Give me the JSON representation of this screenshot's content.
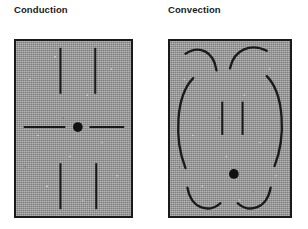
{
  "figure": {
    "width": 308,
    "height": 229,
    "background": "#ffffff",
    "ink_color": "#1a1a1a",
    "medium_fill": "#9a9a9a"
  },
  "panels": [
    {
      "id": "conduction",
      "title": "Conduction",
      "box": {
        "x": 14,
        "y": 39,
        "width": 119,
        "height": 179
      },
      "source_marker": {
        "label": "heat-source-dot",
        "x": 83,
        "y": 128,
        "radius": 5
      },
      "flow_description": "Straight arrows point inward from all four sides toward a central point",
      "arrows": [
        {
          "name": "arrow-down-left",
          "type": "straight",
          "direction": "down",
          "from": [
            60,
            47
          ],
          "to": [
            60,
            100
          ]
        },
        {
          "name": "arrow-down-right",
          "type": "straight",
          "direction": "down",
          "from": [
            96,
            47
          ],
          "to": [
            96,
            100
          ]
        },
        {
          "name": "arrow-right-inward",
          "type": "straight",
          "direction": "right",
          "from": [
            22,
            128
          ],
          "to": [
            71,
            128
          ]
        },
        {
          "name": "arrow-left-inward",
          "type": "straight",
          "direction": "left",
          "from": [
            126,
            128
          ],
          "to": [
            95,
            128
          ]
        },
        {
          "name": "arrow-up-left",
          "type": "straight",
          "direction": "up",
          "from": [
            60,
            211
          ],
          "to": [
            60,
            168
          ]
        },
        {
          "name": "arrow-up-right",
          "type": "straight",
          "direction": "up",
          "from": [
            97,
            211
          ],
          "to": [
            97,
            168
          ]
        }
      ]
    },
    {
      "id": "convection",
      "title": "Convection",
      "box": {
        "x": 168,
        "y": 39,
        "width": 124,
        "height": 179
      },
      "source_marker": {
        "label": "heat-source-dot",
        "x": 234,
        "y": 175,
        "radius": 5
      },
      "flow_description": "Curved circulating arrows form convection cells: fluid descends at the centre and rises along the sides",
      "arrows": [
        {
          "name": "curve-top-left-down",
          "type": "curved",
          "direction": "down-inward"
        },
        {
          "name": "curve-top-right-down",
          "type": "curved",
          "direction": "down-inward"
        },
        {
          "name": "arrow-center-down-left",
          "type": "straight",
          "direction": "down",
          "from": [
            222,
            100
          ],
          "to": [
            222,
            140
          ]
        },
        {
          "name": "arrow-center-down-right",
          "type": "straight",
          "direction": "down",
          "from": [
            243,
            100
          ],
          "to": [
            243,
            140
          ]
        },
        {
          "name": "curve-left-side-up",
          "type": "curved",
          "direction": "up"
        },
        {
          "name": "curve-right-side-up",
          "type": "curved",
          "direction": "up"
        },
        {
          "name": "curve-bottom-left-up",
          "type": "curved",
          "direction": "up-outward"
        },
        {
          "name": "curve-bottom-right-up",
          "type": "curved",
          "direction": "up-outward"
        }
      ]
    }
  ]
}
